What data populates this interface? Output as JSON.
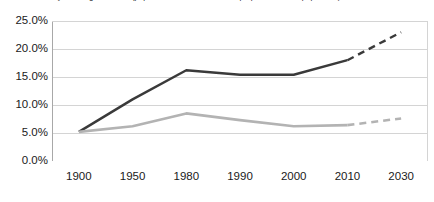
{
  "chart_data": {
    "type": "line",
    "title": "Dynamic age structure (population with certain trait as proportion of total population)",
    "xlabel": "",
    "ylabel": "",
    "categories": [
      "1900",
      "1950",
      "1980",
      "1990",
      "2000",
      "2010",
      "2030"
    ],
    "ylim": [
      0,
      25
    ],
    "ytick_labels": [
      "0.0%",
      "5.0%",
      "10.0%",
      "15.0%",
      "20.0%",
      "25.0%"
    ],
    "ytick_values": [
      0,
      5,
      10,
      15,
      20,
      25
    ],
    "grid": true,
    "grid_axis": "y",
    "legend": false,
    "legend_position": "none",
    "series": [
      {
        "name": "series-dark",
        "color": "#3a3a3a",
        "line_width": 2.4,
        "values": [
          5.2,
          11.0,
          16.2,
          15.4,
          15.4,
          18.0,
          23.0
        ],
        "solid_through_index": 5,
        "projection_style": "dashed",
        "projection_note": "2010 to 2030 shown as dashed projection"
      },
      {
        "name": "series-light",
        "color": "#b3b3b3",
        "line_width": 2.6,
        "values": [
          5.2,
          6.2,
          8.5,
          7.3,
          6.2,
          6.4,
          7.6
        ],
        "solid_through_index": 5,
        "projection_style": "dashed",
        "projection_note": "2010 to 2030 shown as dashed projection"
      }
    ]
  },
  "colors": {
    "dark_series": "#3a3a3a",
    "light_series": "#b3b3b3",
    "gridline": "#d4d4d4",
    "axis": "#a8a8a8",
    "background": "#ffffff",
    "text": "#1a1a1a"
  }
}
